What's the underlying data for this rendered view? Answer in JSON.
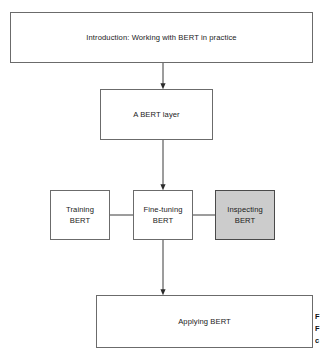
{
  "diagram": {
    "type": "flowchart",
    "orientation": "top-to-bottom",
    "background_color": "#ffffff",
    "nodes": {
      "intro": "Introduction: Working with BERT in practice",
      "layer": "A BERT layer",
      "training": "Training\nBERT",
      "finetuning": "Fine-tuning\nBERT",
      "inspecting": "Inspecting\nBERT",
      "applying": "Applying BERT"
    },
    "colors": {
      "node_fill": "#ffffff",
      "node_border": "#6b6b6b",
      "highlight_fill": "#cccccc",
      "highlight_border": "#4a4a4a",
      "edge": "#3a3a3a",
      "text": "#1a1a1a"
    },
    "edges": [
      {
        "from": "intro",
        "to": "layer",
        "style": "arrow",
        "direction": "down"
      },
      {
        "from": "layer",
        "to": "finetuning",
        "style": "arrow",
        "direction": "down"
      },
      {
        "from": "training",
        "to": "finetuning",
        "style": "line",
        "direction": "horizontal"
      },
      {
        "from": "finetuning",
        "to": "inspecting",
        "style": "line",
        "direction": "horizontal"
      },
      {
        "from": "finetuning",
        "to": "applying",
        "style": "arrow",
        "direction": "down"
      }
    ]
  },
  "margin_note": {
    "line1": "F",
    "line2": "F",
    "line3": "c"
  }
}
